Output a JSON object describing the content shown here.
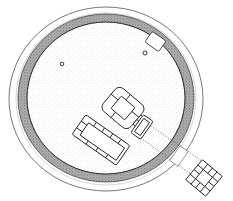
{
  "figure": {
    "type": "archaeological site plan",
    "colors": {
      "background": "#ffffff",
      "ink": "#2a2a2a",
      "stipple": "#9a9a9a",
      "ditch_fill": "#8c8c8c"
    }
  },
  "elements": {
    "outer_ring": {
      "cx": 106,
      "cy": 99,
      "rx": 97,
      "ry": 92
    },
    "ditch_band": {
      "cx": 106,
      "cy": 98,
      "rx_outer": 88,
      "ry_outer": 84,
      "rx_inner": 79,
      "ry_inner": 76
    },
    "postholes": [
      {
        "cx": 62,
        "cy": 64,
        "r": 1.8
      },
      {
        "cx": 145,
        "cy": 53,
        "r": 2
      }
    ],
    "notch_rect": {
      "x": 147,
      "y": 35,
      "w": 17,
      "h": 13,
      "rotate": 35
    },
    "central_chamber": {
      "cx": 123,
      "cy": 108,
      "rotate": 40
    },
    "small_cist": {
      "cx": 142,
      "cy": 127,
      "w": 10,
      "h": 20,
      "rotate": 35
    },
    "long_cist": {
      "cx": 100,
      "cy": 141,
      "w": 52,
      "h": 22,
      "rotate": 35
    },
    "passage": {
      "from": [
        145,
        132
      ],
      "to": [
        205,
        176
      ]
    },
    "external_square": {
      "cx": 204,
      "cy": 178,
      "size": 24,
      "rotate": 40
    }
  }
}
